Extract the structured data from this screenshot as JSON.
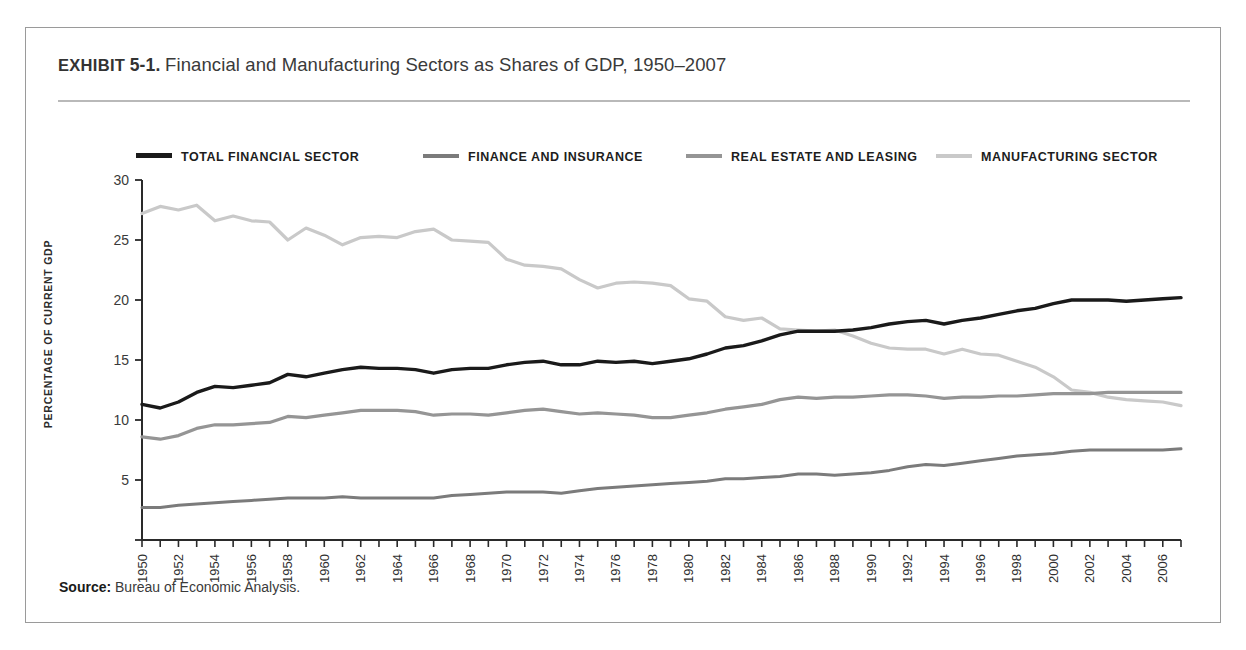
{
  "figure": {
    "exhibit_label": "EXHIBIT",
    "exhibit_number": "5-1.",
    "title": "Financial and Manufacturing Sectors as Shares of GDP, 1950–2007",
    "source_label": "Source:",
    "source_text": "Bureau of Economic Analysis.",
    "border_color": "#9a9a9a"
  },
  "chart_data": {
    "type": "line",
    "title": "Financial and Manufacturing Sectors as Shares of GDP, 1950–2007",
    "xlabel": "",
    "ylabel": "PERCENTAGE OF CURRENT GDP",
    "xlim": [
      1950,
      2007
    ],
    "ylim": [
      0,
      30
    ],
    "yticks": [
      0,
      5,
      10,
      15,
      20,
      25,
      30
    ],
    "ytick_labels": [
      "",
      "5",
      "10",
      "15",
      "20",
      "25",
      "30"
    ],
    "grid": false,
    "legend_position": "top",
    "x": [
      1950,
      1951,
      1952,
      1953,
      1954,
      1955,
      1956,
      1957,
      1958,
      1959,
      1960,
      1961,
      1962,
      1963,
      1964,
      1965,
      1966,
      1967,
      1968,
      1969,
      1970,
      1971,
      1972,
      1973,
      1974,
      1975,
      1976,
      1977,
      1978,
      1979,
      1980,
      1981,
      1982,
      1983,
      1984,
      1985,
      1986,
      1987,
      1988,
      1989,
      1990,
      1991,
      1992,
      1993,
      1994,
      1995,
      1996,
      1997,
      1998,
      1999,
      2000,
      2001,
      2002,
      2003,
      2004,
      2005,
      2006,
      2007
    ],
    "xtick_labels": [
      "1950",
      "1952",
      "1954",
      "1956",
      "1958",
      "1960",
      "1962",
      "1964",
      "1966",
      "1968",
      "1970",
      "1972",
      "1974",
      "1976",
      "1978",
      "1980",
      "1982",
      "1984",
      "1986",
      "1988",
      "1990",
      "1992",
      "1994",
      "1996",
      "1998",
      "2000",
      "2002",
      "2004",
      "2006"
    ],
    "series": [
      {
        "name": "TOTAL FINANCIAL SECTOR",
        "color": "#1a1a1a",
        "width": 3.4,
        "values": [
          11.3,
          11.0,
          11.5,
          12.3,
          12.8,
          12.7,
          12.9,
          13.1,
          13.8,
          13.6,
          13.9,
          14.2,
          14.4,
          14.3,
          14.3,
          14.2,
          13.9,
          14.2,
          14.3,
          14.3,
          14.6,
          14.8,
          14.9,
          14.6,
          14.6,
          14.9,
          14.8,
          14.9,
          14.7,
          14.9,
          15.1,
          15.5,
          16.0,
          16.2,
          16.6,
          17.1,
          17.4,
          17.4,
          17.4,
          17.5,
          17.7,
          18.0,
          18.2,
          18.3,
          18.0,
          18.3,
          18.5,
          18.8,
          19.1,
          19.3,
          19.7,
          20.0,
          20.0,
          20.0,
          19.9,
          20.0,
          20.1,
          20.2
        ]
      },
      {
        "name": "FINANCE AND INSURANCE",
        "color": "#7b7b7b",
        "width": 3.0,
        "values": [
          2.7,
          2.7,
          2.9,
          3.0,
          3.1,
          3.2,
          3.3,
          3.4,
          3.5,
          3.5,
          3.5,
          3.6,
          3.5,
          3.5,
          3.5,
          3.5,
          3.5,
          3.7,
          3.8,
          3.9,
          4.0,
          4.0,
          4.0,
          3.9,
          4.1,
          4.3,
          4.4,
          4.5,
          4.6,
          4.7,
          4.8,
          4.9,
          5.1,
          5.1,
          5.2,
          5.3,
          5.5,
          5.5,
          5.4,
          5.5,
          5.6,
          5.8,
          6.1,
          6.3,
          6.2,
          6.4,
          6.6,
          6.8,
          7.0,
          7.1,
          7.2,
          7.4,
          7.5,
          7.5,
          7.5,
          7.5,
          7.5,
          7.6
        ]
      },
      {
        "name": "REAL ESTATE AND LEASING",
        "color": "#959595",
        "width": 3.2,
        "values": [
          8.6,
          8.4,
          8.7,
          9.3,
          9.6,
          9.6,
          9.7,
          9.8,
          10.3,
          10.2,
          10.4,
          10.6,
          10.8,
          10.8,
          10.8,
          10.7,
          10.4,
          10.5,
          10.5,
          10.4,
          10.6,
          10.8,
          10.9,
          10.7,
          10.5,
          10.6,
          10.5,
          10.4,
          10.2,
          10.2,
          10.4,
          10.6,
          10.9,
          11.1,
          11.3,
          11.7,
          11.9,
          11.8,
          11.9,
          11.9,
          12.0,
          12.1,
          12.1,
          12.0,
          11.8,
          11.9,
          11.9,
          12.0,
          12.0,
          12.1,
          12.2,
          12.2,
          12.2,
          12.3,
          12.3,
          12.3,
          12.3,
          12.3
        ]
      },
      {
        "name": "MANUFACTURING SECTOR",
        "color": "#c9c9c9",
        "width": 3.2,
        "values": [
          27.2,
          27.8,
          27.5,
          27.9,
          26.6,
          27.0,
          26.6,
          26.5,
          25.0,
          26.0,
          25.4,
          24.6,
          25.2,
          25.3,
          25.2,
          25.7,
          25.9,
          25.0,
          24.9,
          24.8,
          23.4,
          22.9,
          22.8,
          22.6,
          21.7,
          21.0,
          21.4,
          21.5,
          21.4,
          21.2,
          20.1,
          19.9,
          18.6,
          18.3,
          18.5,
          17.6,
          17.5,
          17.4,
          17.5,
          17.0,
          16.4,
          16.0,
          15.9,
          15.9,
          15.5,
          15.9,
          15.5,
          15.4,
          14.9,
          14.4,
          13.6,
          12.5,
          12.3,
          11.9,
          11.7,
          11.6,
          11.5,
          11.2
        ]
      }
    ]
  }
}
